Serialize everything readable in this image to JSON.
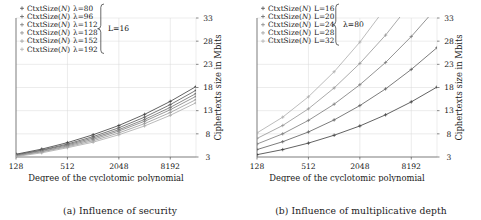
{
  "figure": {
    "panels": [
      {
        "id": "panel-a",
        "caption": "(a) Influence of security",
        "axes": {
          "xlabel": "Degree of the cyclotomic polynomial",
          "ylabel": "Ciphertexts size in Mbits",
          "xticks": [
            "128",
            "512",
            "2048",
            "8192"
          ],
          "yticks": [
            "3",
            "8",
            "13",
            "18",
            "23",
            "28",
            "33"
          ],
          "xscale": "log2",
          "yrange": [
            3,
            33
          ],
          "xrange": [
            128,
            16384
          ],
          "grid": true
        },
        "legend": {
          "position": "top-left",
          "brace_label": "L=16",
          "entries": [
            {
              "name": "CtxtSize",
              "arg": "N",
              "param": "λ=80",
              "marker": "plus",
              "color": "#3a3a3a"
            },
            {
              "name": "CtxtSize",
              "arg": "N",
              "param": "λ=96",
              "marker": "plus",
              "color": "#555555"
            },
            {
              "name": "CtxtSize",
              "arg": "N",
              "param": "λ=112",
              "marker": "plus",
              "color": "#6b6b6b"
            },
            {
              "name": "CtxtSize",
              "arg": "N",
              "param": "λ=128",
              "marker": "plus",
              "color": "#7f7f7f"
            },
            {
              "name": "CtxtSize",
              "arg": "N",
              "param": "λ=152",
              "marker": "plus",
              "color": "#959595"
            },
            {
              "name": "CtxtSize",
              "arg": "N",
              "param": "λ=192",
              "marker": "plus",
              "color": "#a8a8a8"
            }
          ]
        }
      },
      {
        "id": "panel-b",
        "caption": "(b) Influence of multiplicative depth",
        "axes": {
          "xlabel": "Degree of the cyclotomic polynomial",
          "ylabel": "Ciphertexts size in Mbits",
          "xticks": [
            "128",
            "512",
            "2048",
            "8192"
          ],
          "yticks": [
            "3",
            "8",
            "13",
            "18",
            "23",
            "28",
            "33"
          ],
          "xscale": "log2",
          "yrange": [
            3,
            33
          ],
          "xrange": [
            128,
            16384
          ],
          "grid": true
        },
        "legend": {
          "position": "top-left",
          "brace_label": "λ=80",
          "entries": [
            {
              "name": "CtxtSize",
              "arg": "N",
              "param": "L=16",
              "marker": "plus",
              "color": "#3a3a3a"
            },
            {
              "name": "CtxtSize",
              "arg": "N",
              "param": "L=20",
              "marker": "plus",
              "color": "#5a5a5a"
            },
            {
              "name": "CtxtSize",
              "arg": "N",
              "param": "L=24",
              "marker": "plus",
              "color": "#787878"
            },
            {
              "name": "CtxtSize",
              "arg": "N",
              "param": "L=28",
              "marker": "plus",
              "color": "#949494"
            },
            {
              "name": "CtxtSize",
              "arg": "N",
              "param": "L=32",
              "marker": "plus",
              "color": "#ababab"
            }
          ]
        }
      }
    ]
  },
  "chart_data": [
    {
      "type": "line",
      "title": "(a) Influence of security",
      "xlabel": "Degree of the cyclotomic polynomial",
      "ylabel": "Ciphertexts size in Mbits",
      "xscale": "log2",
      "x": [
        128,
        256,
        512,
        1024,
        2048,
        4096,
        8192,
        16384
      ],
      "xlim": [
        128,
        16384
      ],
      "ylim": [
        3,
        33
      ],
      "xticks": [
        128,
        512,
        2048,
        8192
      ],
      "yticks": [
        3,
        8,
        13,
        18,
        23,
        28,
        33
      ],
      "grid": true,
      "legend": "top-left",
      "annotation": "L=16",
      "series": [
        {
          "name": "CtxtSize(N) λ=80",
          "values": [
            3.6,
            4.7,
            6.1,
            7.8,
            9.8,
            12.2,
            15.0,
            18.2
          ]
        },
        {
          "name": "CtxtSize(N) λ=96",
          "values": [
            3.5,
            4.5,
            5.8,
            7.4,
            9.3,
            11.6,
            14.3,
            17.4
          ]
        },
        {
          "name": "CtxtSize(N) λ=112",
          "values": [
            3.4,
            4.4,
            5.6,
            7.1,
            8.9,
            11.1,
            13.7,
            16.7
          ]
        },
        {
          "name": "CtxtSize(N) λ=128",
          "values": [
            3.3,
            4.2,
            5.4,
            6.8,
            8.6,
            10.7,
            13.2,
            16.1
          ]
        },
        {
          "name": "CtxtSize(N) λ=152",
          "values": [
            3.2,
            4.1,
            5.2,
            6.5,
            8.2,
            10.2,
            12.6,
            15.4
          ]
        },
        {
          "name": "CtxtSize(N) λ=192",
          "values": [
            3.1,
            3.9,
            5.0,
            6.2,
            7.8,
            9.7,
            12.0,
            14.7
          ]
        }
      ]
    },
    {
      "type": "line",
      "title": "(b) Influence of multiplicative depth",
      "xlabel": "Degree of the cyclotomic polynomial",
      "ylabel": "Ciphertexts size in Mbits",
      "xscale": "log2",
      "x": [
        128,
        256,
        512,
        1024,
        2048,
        4096,
        8192,
        16384
      ],
      "xlim": [
        128,
        16384
      ],
      "ylim": [
        3,
        33
      ],
      "xticks": [
        128,
        512,
        2048,
        8192
      ],
      "yticks": [
        3,
        8,
        13,
        18,
        23,
        28,
        33
      ],
      "grid": true,
      "legend": "top-left",
      "annotation": "λ=80",
      "series": [
        {
          "name": "CtxtSize(N) L=16",
          "values": [
            3.5,
            4.6,
            6.0,
            7.7,
            9.7,
            12.1,
            14.9,
            18.1
          ]
        },
        {
          "name": "CtxtSize(N) L=20",
          "values": [
            4.6,
            6.3,
            8.4,
            11.0,
            14.1,
            17.7,
            21.9,
            26.6
          ]
        },
        {
          "name": "CtxtSize(N) L=24",
          "values": [
            5.8,
            8.0,
            10.9,
            14.4,
            18.6,
            23.4,
            29.0,
            35.3
          ]
        },
        {
          "name": "CtxtSize(N) L=28",
          "values": [
            7.0,
            9.8,
            13.4,
            17.9,
            23.2,
            29.3,
            36.3,
            44.2
          ]
        },
        {
          "name": "CtxtSize(N) L=32",
          "values": [
            8.2,
            11.6,
            16.0,
            21.4,
            27.8,
            35.2,
            43.6,
            53.1
          ]
        }
      ]
    }
  ]
}
